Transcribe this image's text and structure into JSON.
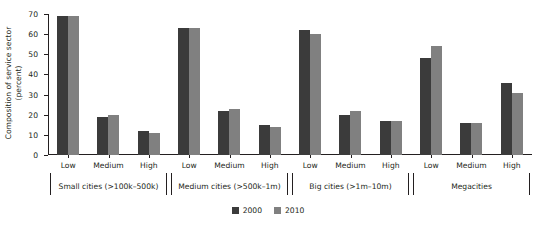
{
  "chart_data": {
    "type": "bar",
    "title": "",
    "xlabel": "",
    "ylabel": "Composition of service sector (percent)",
    "ylabel_line1": "Composition of service sector",
    "ylabel_line2": "(percent)",
    "ylim": [
      0,
      70
    ],
    "ytick_labels": [
      "0",
      "10",
      "20",
      "30",
      "40",
      "50",
      "60",
      "70"
    ],
    "ytick_values": [
      0,
      10,
      20,
      30,
      40,
      50,
      60,
      70
    ],
    "grid": false,
    "legend_position": "bottom-center",
    "categories": [
      "Low",
      "Medium",
      "High"
    ],
    "groups": [
      {
        "name": "Small cities (>100k–500k)",
        "categories": [
          "Low",
          "Medium",
          "High"
        ],
        "series": [
          {
            "name": "2000",
            "values": [
              69,
              19,
              12
            ]
          },
          {
            "name": "2010",
            "values": [
              69,
              20,
              11
            ]
          }
        ]
      },
      {
        "name": "Medium cities (>500k–1m)",
        "categories": [
          "Low",
          "Medium",
          "High"
        ],
        "series": [
          {
            "name": "2000",
            "values": [
              63,
              22,
              15
            ]
          },
          {
            "name": "2010",
            "values": [
              63,
              23,
              14
            ]
          }
        ]
      },
      {
        "name": "Big cities (>1m–10m)",
        "categories": [
          "Low",
          "Medium",
          "High"
        ],
        "series": [
          {
            "name": "2000",
            "values": [
              62,
              20,
              17
            ]
          },
          {
            "name": "2010",
            "values": [
              60,
              22,
              17
            ]
          }
        ]
      },
      {
        "name": "Megacities",
        "categories": [
          "Low",
          "Medium",
          "High"
        ],
        "series": [
          {
            "name": "2000",
            "values": [
              48,
              16,
              36
            ]
          },
          {
            "name": "2010",
            "values": [
              54,
              16,
              31
            ]
          }
        ]
      }
    ],
    "legend": [
      {
        "label": "2000",
        "color": "#3b3b3b"
      },
      {
        "label": "2010",
        "color": "#808080"
      }
    ]
  }
}
